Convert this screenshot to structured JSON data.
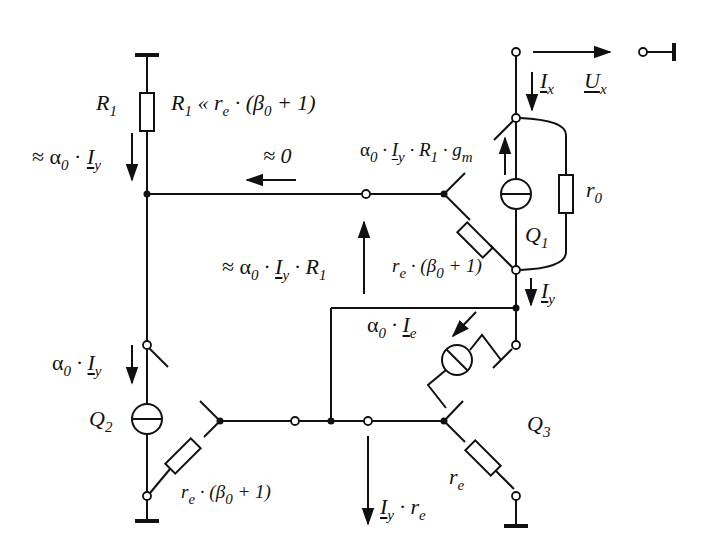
{
  "diagram": {
    "type": "small-signal equivalent circuit (current mirror / Wilson-type output resistance)",
    "colors": {
      "line": "#111111",
      "background": "#ffffff"
    },
    "components": {
      "R1": {
        "label": "R",
        "sub": "1"
      },
      "r0": {
        "label": "r",
        "sub": "0"
      },
      "Q1": {
        "label": "Q",
        "sub": "1"
      },
      "Q2": {
        "label": "Q",
        "sub": "2"
      },
      "Q3": {
        "label": "Q",
        "sub": "3"
      }
    },
    "annotations": {
      "r1_condition": {
        "pre": "R",
        "sub1": "1",
        "mid": " « r",
        "sub2": "e",
        "post": " · (β",
        "sub3": "0",
        "end": " + 1)"
      },
      "r1_current": {
        "pre": "≈ α",
        "sub1": "0",
        "mid": " · ",
        "var": "I",
        "sub2": "y"
      },
      "approx_zero": "≈ 0",
      "q1_gm_source": {
        "pre": "α",
        "sub1": "0",
        "mid": " · ",
        "var": "I",
        "sub2": "y",
        "mid2": " · R",
        "sub3": "1",
        "mid3": " · g",
        "sub4": "m"
      },
      "voltage_r1": {
        "pre": "≈ α",
        "sub1": "0",
        "mid": " · ",
        "var": "I",
        "sub2": "y",
        "mid2": " · R",
        "sub3": "1"
      },
      "q1_re": {
        "pre": "r",
        "sub1": "e",
        "mid": " · (β",
        "sub2": "0",
        "end": " + 1)"
      },
      "ix": {
        "var": "I",
        "sub": "x"
      },
      "ux": {
        "var": "U",
        "sub": "x"
      },
      "iy": {
        "var": "I",
        "sub": "y"
      },
      "q3_source": {
        "pre": "α",
        "sub1": "0",
        "mid": " · ",
        "var": "I",
        "sub2": "e"
      },
      "q2_current": {
        "pre": "α",
        "sub1": "0",
        "mid": " · ",
        "var": "I",
        "sub2": "y"
      },
      "q2_re": {
        "pre": "r",
        "sub1": "e",
        "mid": " · (β",
        "sub2": "0",
        "end": " + 1)"
      },
      "q3_re": {
        "pre": "r",
        "sub1": "e"
      },
      "voltage_re": {
        "var": "I",
        "sub1": "y",
        "mid": " · r",
        "sub2": "e"
      }
    }
  }
}
